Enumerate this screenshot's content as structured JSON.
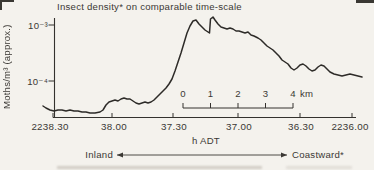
{
  "colors": {
    "ink": "#34322e",
    "background": "#f4f2ed",
    "text": "#3b3834"
  },
  "chart_data": {
    "type": "line",
    "title": "Insect density* on comparable time-scale",
    "xlabel": "h ADT",
    "ylabel": "Moths/m³ (approx.)",
    "y_scale": "log",
    "ylim": [
      2e-05,
      0.002
    ],
    "grid": false,
    "legend": "none",
    "y_ticks": [
      {
        "label": "10⁻³",
        "value": 0.001
      },
      {
        "label": "10⁻⁴",
        "value": 0.0001
      }
    ],
    "x_ticks": [
      {
        "label": "2238.30",
        "t_seconds_after_2236": 150
      },
      {
        "label": "38.00",
        "t_seconds_after_2236": 120
      },
      {
        "label": "37.30",
        "t_seconds_after_2236": 90
      },
      {
        "label": "37.00",
        "t_seconds_after_2236": 60
      },
      {
        "label": "36.30",
        "t_seconds_after_2236": 30
      },
      {
        "label": "2236.00",
        "t_seconds_after_2236": 0
      }
    ],
    "x_axis_note": "time of day (h ADT) decreasing left to right",
    "series": [
      {
        "name": "Insect density (moths/m³)",
        "points_t_v": [
          [
            155,
            3.6e-05
          ],
          [
            150,
            2.9e-05
          ],
          [
            144,
            2.9e-05
          ],
          [
            138,
            2.9e-05
          ],
          [
            132,
            2.7e-05
          ],
          [
            126,
            2.8e-05
          ],
          [
            122,
            3.9e-05
          ],
          [
            119,
            4.6e-05
          ],
          [
            115,
            5e-05
          ],
          [
            111,
            4.6e-05
          ],
          [
            108,
            3.9e-05
          ],
          [
            104,
            4.2e-05
          ],
          [
            101,
            4.1e-05
          ],
          [
            98,
            5e-05
          ],
          [
            95,
            6.4e-05
          ],
          [
            92,
            8.5e-05
          ],
          [
            89,
            0.00014
          ],
          [
            87,
            0.00028
          ],
          [
            84,
            0.00061
          ],
          [
            81,
            0.00113
          ],
          [
            80,
            0.00123
          ],
          [
            77,
            0.00096
          ],
          [
            74,
            0.00075
          ],
          [
            73.5,
            0.00072
          ],
          [
            73,
            0.00123
          ],
          [
            72,
            0.00139
          ],
          [
            70,
            0.00109
          ],
          [
            67,
            0.00088
          ],
          [
            64,
            0.00088
          ],
          [
            60,
            0.00081
          ],
          [
            58,
            0.00072
          ],
          [
            55,
            0.00069
          ],
          [
            51,
            0.00061
          ],
          [
            48,
            0.00052
          ],
          [
            45,
            0.0004
          ],
          [
            43,
            0.00034
          ],
          [
            40,
            0.00027
          ],
          [
            37,
            0.00022
          ],
          [
            34,
            0.00017
          ],
          [
            31,
            0.00018
          ],
          [
            28,
            0.0002
          ],
          [
            24,
            0.00016
          ],
          [
            21,
            0.00016
          ],
          [
            17,
            0.00019
          ],
          [
            14,
            0.00016
          ],
          [
            10,
            0.000133
          ],
          [
            6,
            0.000123
          ],
          [
            2,
            0.000133
          ],
          [
            -2,
            0.000123
          ],
          [
            -6,
            0.000118
          ]
        ]
      }
    ],
    "scale_bar": {
      "tick_labels": [
        "0",
        "1",
        "2",
        "3",
        "4"
      ],
      "unit": "km"
    },
    "direction_annotation": {
      "left": "Inland",
      "right": "Coastward*"
    },
    "layout": {
      "axis": {
        "y_axis_x_px": 54.5,
        "y_axis_top_px": 18,
        "x_axis_y_px": 117.5,
        "x_left_px": 53,
        "x_right_px": 356,
        "x_tick_px": [
          53,
          112,
          173,
          238,
          300,
          352
        ],
        "x_tick_label_center_px": [
          50,
          114,
          174,
          239,
          301,
          350
        ],
        "x_tick_len": 4.5,
        "y_tick_px": [
          25,
          81
        ],
        "y_tick_len": 6,
        "y_tick_label_right_px": 48
      },
      "scale_bar_px": {
        "y": 108,
        "tick_xs": [
          183,
          210.5,
          238,
          265.5,
          293
        ],
        "tick_len": 5
      },
      "arrow_px": {
        "y": 155,
        "x1": 117,
        "x2": 287,
        "head": 6
      },
      "curve_px": [
        [
          43,
          106
        ],
        [
          46,
          108
        ],
        [
          50,
          110
        ],
        [
          54,
          111
        ],
        [
          58,
          110
        ],
        [
          62,
          110
        ],
        [
          66,
          111
        ],
        [
          70,
          110
        ],
        [
          74,
          111
        ],
        [
          78,
          111
        ],
        [
          82,
          112
        ],
        [
          86,
          112
        ],
        [
          90,
          113
        ],
        [
          95,
          113
        ],
        [
          100,
          112
        ],
        [
          103,
          110
        ],
        [
          106,
          105
        ],
        [
          109,
          102
        ],
        [
          112,
          101
        ],
        [
          115,
          100
        ],
        [
          118,
          101
        ],
        [
          121,
          99
        ],
        [
          124,
          98
        ],
        [
          127,
          99
        ],
        [
          130,
          99
        ],
        [
          133,
          101
        ],
        [
          136,
          103
        ],
        [
          139,
          104
        ],
        [
          142,
          103
        ],
        [
          145,
          102
        ],
        [
          148,
          103
        ],
        [
          151,
          102
        ],
        [
          154,
          100
        ],
        [
          157,
          97
        ],
        [
          160,
          94
        ],
        [
          163,
          91
        ],
        [
          166,
          88
        ],
        [
          169,
          84
        ],
        [
          172,
          79
        ],
        [
          175,
          71
        ],
        [
          178,
          62
        ],
        [
          181,
          53
        ],
        [
          184,
          43
        ],
        [
          187,
          33
        ],
        [
          190,
          26
        ],
        [
          193,
          21
        ],
        [
          196,
          20
        ],
        [
          199,
          24
        ],
        [
          202,
          27
        ],
        [
          205,
          30
        ],
        [
          208,
          32
        ],
        [
          209.5,
          33
        ],
        [
          210.5,
          19
        ],
        [
          213,
          17
        ],
        [
          215,
          20
        ],
        [
          218,
          24
        ],
        [
          221,
          27
        ],
        [
          224,
          28
        ],
        [
          227,
          29
        ],
        [
          230,
          28
        ],
        [
          233,
          29
        ],
        [
          236,
          31
        ],
        [
          239,
          31
        ],
        [
          242,
          32
        ],
        [
          245,
          33
        ],
        [
          248,
          32
        ],
        [
          251,
          35
        ],
        [
          254,
          36
        ],
        [
          258,
          38
        ],
        [
          261,
          40
        ],
        [
          264,
          43
        ],
        [
          267,
          46
        ],
        [
          270,
          48
        ],
        [
          273,
          50
        ],
        [
          276,
          53
        ],
        [
          279,
          56
        ],
        [
          282,
          60
        ],
        [
          285,
          62
        ],
        [
          288,
          64
        ],
        [
          291,
          68
        ],
        [
          294,
          70
        ],
        [
          297,
          68
        ],
        [
          300,
          65
        ],
        [
          303,
          64
        ],
        [
          306,
          66
        ],
        [
          309,
          69
        ],
        [
          312,
          71
        ],
        [
          315,
          70
        ],
        [
          318,
          67
        ],
        [
          321,
          65
        ],
        [
          324,
          66
        ],
        [
          327,
          69
        ],
        [
          330,
          72
        ],
        [
          334,
          74
        ],
        [
          338,
          75
        ],
        [
          342,
          76
        ],
        [
          346,
          75
        ],
        [
          350,
          74
        ],
        [
          354,
          75
        ],
        [
          358,
          76
        ],
        [
          362,
          77
        ]
      ]
    }
  }
}
